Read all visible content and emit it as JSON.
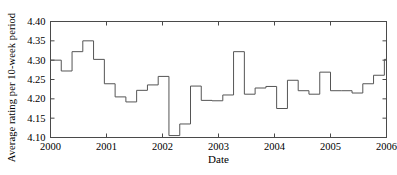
{
  "chart_data": {
    "type": "line",
    "subtype": "step",
    "title": "",
    "xlabel": "Date",
    "ylabel": "Average rating per 10-week period",
    "xlim": [
      2000,
      2006
    ],
    "ylim": [
      4.1,
      4.4
    ],
    "xticks": [
      2000,
      2001,
      2002,
      2003,
      2004,
      2005,
      2006
    ],
    "xticklabels": [
      "2000",
      "2001",
      "2002",
      "2003",
      "2004",
      "2005",
      "2006"
    ],
    "yticks": [
      4.1,
      4.15,
      4.2,
      4.25,
      4.3,
      4.35,
      4.4
    ],
    "yticklabels": [
      "4.10",
      "4.15",
      "4.20",
      "4.25",
      "4.30",
      "4.35",
      "4.40"
    ],
    "grid": false,
    "legend": null,
    "line_color": "#555555",
    "x_period_years": 0.1923,
    "x": [
      2000.0,
      2000.192,
      2000.385,
      2000.577,
      2000.769,
      2000.962,
      2001.154,
      2001.346,
      2001.538,
      2001.731,
      2001.923,
      2002.115,
      2002.308,
      2002.5,
      2002.692,
      2002.885,
      2003.077,
      2003.269,
      2003.462,
      2003.654,
      2003.846,
      2004.038,
      2004.231,
      2004.423,
      2004.615,
      2004.808,
      2005.0,
      2005.192,
      2005.385,
      2005.577,
      2005.769,
      2005.962
    ],
    "values": [
      4.3,
      4.272,
      4.322,
      4.35,
      4.302,
      4.239,
      4.205,
      4.192,
      4.222,
      4.236,
      4.258,
      4.105,
      4.135,
      4.233,
      4.196,
      4.195,
      4.21,
      4.322,
      4.212,
      4.228,
      4.232,
      4.175,
      4.248,
      4.221,
      4.212,
      4.269,
      4.221,
      4.221,
      4.215,
      4.239,
      4.261,
      4.302
    ],
    "series_name": "Average rating"
  },
  "axis": {
    "xlabel": "Date",
    "ylabel": "Average rating per 10-week period"
  }
}
